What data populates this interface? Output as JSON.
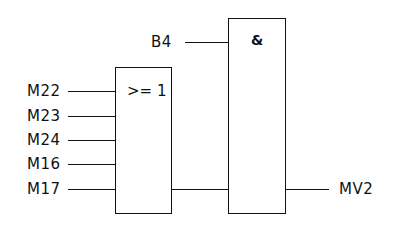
{
  "diagram": {
    "type": "logic-function-block-diagram",
    "or_gate": {
      "symbol": ">= 1",
      "inputs": [
        "M22",
        "M23",
        "M24",
        "M16",
        "M17"
      ]
    },
    "and_gate": {
      "symbol": "&",
      "inputs": [
        "B4",
        "OR output"
      ]
    },
    "labels": {
      "b4": "B4",
      "m22": "M22",
      "m23": "M23",
      "m24": "M24",
      "m16": "M16",
      "m17": "M17",
      "output": "MV2"
    }
  }
}
